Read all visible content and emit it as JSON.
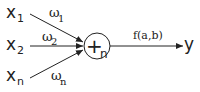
{
  "diagram": {
    "type": "neuron / weighted sum node",
    "inputs": [
      {
        "label": "x",
        "sub": "1",
        "weight": "ω",
        "weight_sub": "1"
      },
      {
        "label": "x",
        "sub": "2",
        "weight": "ω",
        "weight_sub": "2"
      },
      {
        "label": "x",
        "sub": "n",
        "weight": "ω",
        "weight_sub": "n"
      }
    ],
    "node": {
      "symbol": "+",
      "sub": "n"
    },
    "activation": "f(a,b)",
    "output": "y",
    "colors": {
      "stroke": "#222222",
      "background": "#ffffff"
    }
  }
}
